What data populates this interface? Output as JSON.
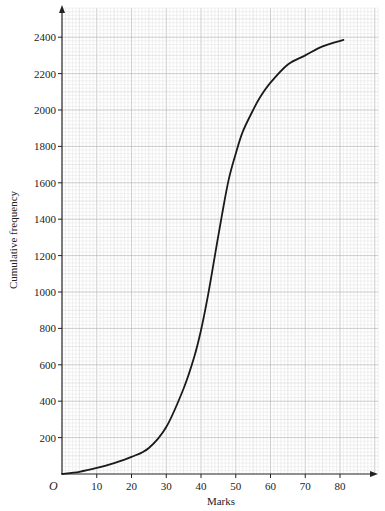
{
  "chart_data": {
    "type": "line",
    "title": "",
    "xlabel": "Marks",
    "ylabel": "Cumulative frequency",
    "origin_label": "O",
    "xlim": [
      0,
      91
    ],
    "ylim": [
      0,
      2560
    ],
    "x_ticks": [
      10,
      20,
      30,
      40,
      50,
      60,
      70,
      80
    ],
    "y_ticks": [
      200,
      400,
      600,
      800,
      1000,
      1200,
      1400,
      1600,
      1800,
      2000,
      2200,
      2400
    ],
    "grid": true,
    "grid_minor_x": 1,
    "grid_minor_y": 20,
    "legend": null,
    "series": [
      {
        "name": "Cumulative frequency curve",
        "color": "#1a1a1a",
        "x": [
          0,
          5,
          10,
          15,
          20,
          25,
          30,
          35,
          38,
          40,
          42,
          44,
          46,
          48,
          50,
          52,
          55,
          57,
          60,
          65,
          70,
          75,
          81
        ],
        "y": [
          0,
          12,
          33,
          60,
          94,
          143,
          258,
          470,
          640,
          790,
          980,
          1200,
          1420,
          1620,
          1760,
          1880,
          2000,
          2070,
          2150,
          2250,
          2300,
          2350,
          2385
        ]
      }
    ]
  },
  "colors": {
    "grid_minor": "#e2e2e2",
    "grid_mid": "#cfcfcf",
    "grid_major": "#b8b8b8",
    "axis": "#222222",
    "curve": "#1a1a1a"
  }
}
